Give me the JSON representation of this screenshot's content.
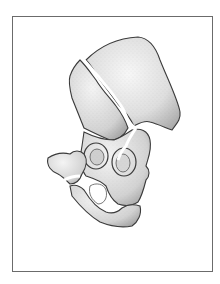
{
  "figure": {
    "style": "stippled pencil drawing, grayscale",
    "colors": {
      "outline": "#3a3a3a",
      "bone_light": "#f2f2f2",
      "bone_shade": "#bdbdbd",
      "frame_border": "#6b6b6b",
      "background": "#ffffff"
    },
    "fracture_lines": 3
  }
}
